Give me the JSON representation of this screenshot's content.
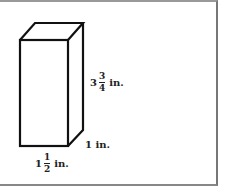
{
  "figure": {
    "shape": "rectangular prism",
    "height_label": {
      "whole": "3",
      "numerator": "3",
      "denominator": "4",
      "unit": "in."
    },
    "depth_label": {
      "text": "1 in."
    },
    "width_label": {
      "whole": "1",
      "numerator": "1",
      "denominator": "2",
      "unit": "in."
    }
  }
}
